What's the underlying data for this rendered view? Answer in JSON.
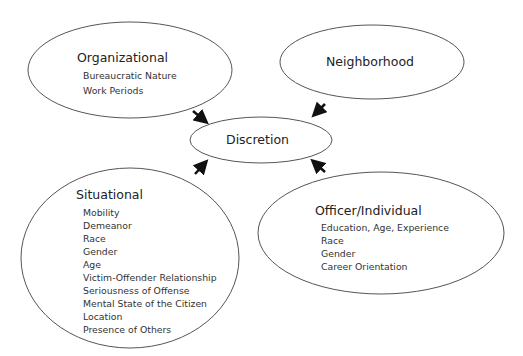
{
  "diagram": {
    "center": {
      "label": "Discretion"
    },
    "nodes": [
      {
        "id": "organizational",
        "title": "Organizational",
        "items": [
          "Bureaucratic Nature",
          "Work Periods"
        ]
      },
      {
        "id": "neighborhood",
        "title": "Neighborhood",
        "items": []
      },
      {
        "id": "situational",
        "title": "Situational",
        "items": [
          "Mobility",
          "Demeanor",
          "Race",
          "Gender",
          "Age",
          "Victim-Offender Relationship",
          "Seriousness of Offense",
          "Mental State of the Citizen",
          "Location",
          "Presence of Others"
        ]
      },
      {
        "id": "officer",
        "title": "Officer/Individual",
        "items": [
          "Education, Age, Experience",
          "Race",
          "Gender",
          "Career Orientation"
        ]
      }
    ],
    "edges": [
      {
        "from": "organizational",
        "to": "discretion"
      },
      {
        "from": "neighborhood",
        "to": "discretion"
      },
      {
        "from": "situational",
        "to": "discretion"
      },
      {
        "from": "officer",
        "to": "discretion"
      }
    ],
    "colors": {
      "stroke": "#555555",
      "arrow": "#111111",
      "text": "#222222"
    }
  }
}
